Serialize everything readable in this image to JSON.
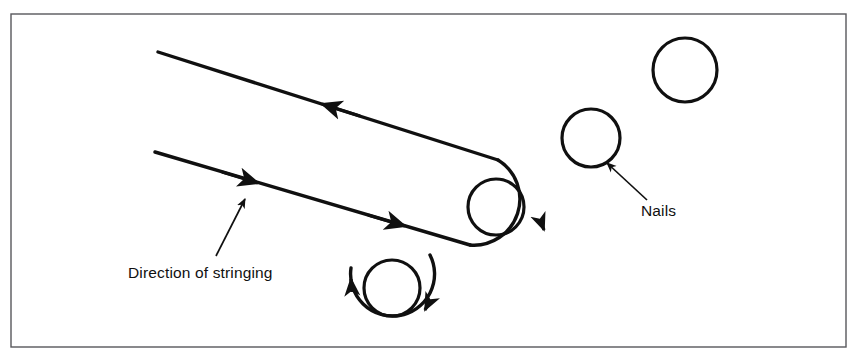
{
  "figure": {
    "background_color": "#ffffff",
    "border": {
      "name": "figure-border",
      "color": "#58585c",
      "width": 1.4,
      "x": 11,
      "y": 14,
      "w": 835,
      "h": 333
    },
    "stroke_color": "#101010",
    "labels": {
      "direction": "Direction of stringing",
      "nails": "Nails"
    },
    "nails": [
      {
        "name": "nail-top-right",
        "cx": 685,
        "cy": 70,
        "r": 32,
        "wrapped": false
      },
      {
        "name": "nail-middle-right",
        "cx": 591,
        "cy": 138,
        "r": 29,
        "wrapped": false
      },
      {
        "name": "nail-string-wrapped-right",
        "cx": 496,
        "cy": 207,
        "r": 28,
        "wrapped": true
      },
      {
        "name": "nail-string-wrapped-lower-left",
        "cx": 392,
        "cy": 288,
        "r": 28,
        "wrapped": true
      }
    ],
    "string_paths": {
      "upper_line_start": [
        158,
        52
      ],
      "upper_line_end": [
        498,
        160
      ],
      "lower_line_start": [
        155,
        152
      ],
      "lower_line_end": [
        470,
        244
      ]
    },
    "arrow_count": 7
  }
}
